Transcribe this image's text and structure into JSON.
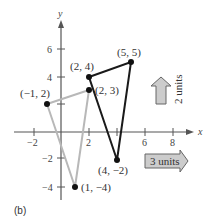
{
  "caption": "(b)",
  "axes": {
    "x_label": "x",
    "y_label": "y",
    "x_ticks": [
      "−2",
      "2",
      "4",
      "6",
      "8"
    ],
    "y_ticks": [
      "6",
      "4",
      "2",
      "−2",
      "−4"
    ]
  },
  "original_triangle": {
    "color": "#b3b3b3",
    "points": [
      {
        "label": "(−1, 2)",
        "x": -1,
        "y": 2
      },
      {
        "label": "(2, 3)",
        "x": 2,
        "y": 3
      },
      {
        "label": "(1, −4)",
        "x": 1,
        "y": -4
      }
    ]
  },
  "translated_triangle": {
    "color": "#1a1a1a",
    "points": [
      {
        "label": "(2, 4)",
        "x": 2,
        "y": 4
      },
      {
        "label": "(5, 5)",
        "x": 5,
        "y": 5
      },
      {
        "label": "(4, −2)",
        "x": 4,
        "y": -2
      }
    ]
  },
  "arrows": {
    "up_label": "2 units",
    "right_label": "3 units"
  }
}
